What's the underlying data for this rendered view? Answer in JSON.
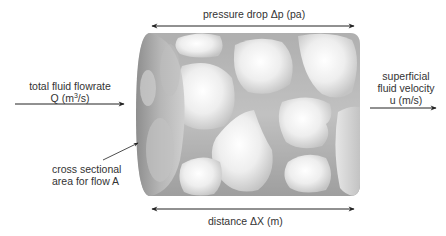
{
  "diagram": {
    "labels": {
      "pressure_drop": "pressure drop Δp (pa)",
      "distance": "distance ΔX (m)",
      "flowrate_line1": "total fluid flowrate",
      "flowrate_line2_prefix": "Q (m",
      "flowrate_line2_sup": "3",
      "flowrate_line2_suffix": "/s)",
      "velocity_line1": "superficial",
      "velocity_line2": "fluid velocity",
      "velocity_line3": "u (m/s)",
      "area_line1": "cross sectional",
      "area_line2": "area for flow A"
    },
    "colors": {
      "background": "#ffffff",
      "cylinder_dark": "#8a8a8a",
      "cylinder_mid": "#a9a9a9",
      "particle_light": "#f4f4f4",
      "particle_edge": "#c8c8c8",
      "arrow": "#222222",
      "text": "#333333"
    }
  }
}
